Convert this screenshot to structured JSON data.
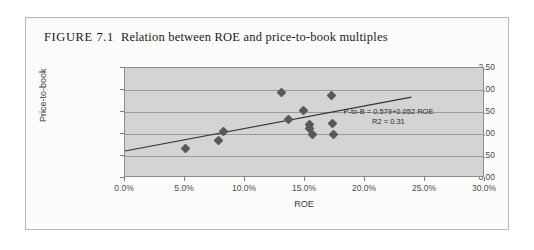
{
  "figure": {
    "label": "FIGURE 7.1",
    "title": "Relation between ROE and price-to-book multiples"
  },
  "chart_data": {
    "type": "scatter",
    "title": "Relation between ROE and price-to-book multiples",
    "xlabel": "ROE",
    "ylabel": "Price-to-book",
    "xlim": [
      0,
      30
    ],
    "ylim": [
      0,
      2.5
    ],
    "x_tick_labels": [
      "0.0%",
      "5.0%",
      "10.0%",
      "15.0%",
      "20.0%",
      "25.0%",
      "30.0%"
    ],
    "x_tick_values": [
      0,
      5,
      10,
      15,
      20,
      25,
      30
    ],
    "y_tick_labels": [
      "0.00",
      "0.50",
      "1.00",
      "1.50",
      "2.00",
      "2.50"
    ],
    "y_tick_values": [
      0,
      0.5,
      1,
      1.5,
      2,
      2.5
    ],
    "grid": true,
    "legend": "none",
    "marker_color": "#595959",
    "plot_bg_color": "#d4d4d4",
    "points": [
      {
        "x": 5.0,
        "y": 0.66
      },
      {
        "x": 7.8,
        "y": 0.85
      },
      {
        "x": 8.2,
        "y": 1.06
      },
      {
        "x": 13.0,
        "y": 1.95
      },
      {
        "x": 13.6,
        "y": 1.33
      },
      {
        "x": 14.9,
        "y": 1.53
      },
      {
        "x": 15.4,
        "y": 1.22
      },
      {
        "x": 15.4,
        "y": 1.12
      },
      {
        "x": 15.6,
        "y": 0.98
      },
      {
        "x": 17.2,
        "y": 1.87
      },
      {
        "x": 17.3,
        "y": 1.25
      },
      {
        "x": 17.4,
        "y": 1.0
      }
    ],
    "trendline": {
      "intercept": 0.579,
      "slope": 0.052,
      "x_start": 0.0,
      "x_end": 24.0
    },
    "annotation": {
      "equation": "P-to-B = 0.579+0.052 ROE",
      "r_squared": "R2 = 0.31"
    }
  }
}
